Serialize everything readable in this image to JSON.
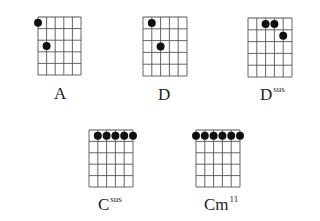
{
  "figure": {
    "strings": 6,
    "frets": 5,
    "line_color": "#555555",
    "dot_color": "#111111",
    "chords": [
      {
        "name": "A",
        "suffix": "",
        "position": "V",
        "grid": {
          "x": 38,
          "y": 17,
          "w": 43,
          "h": 58
        },
        "label": {
          "x": 54,
          "y": 85
        },
        "dots": [
          {
            "string": 1,
            "fret": 1
          },
          {
            "string": 2,
            "fret": 3
          }
        ]
      },
      {
        "name": "D",
        "suffix": "",
        "position": "V",
        "grid": {
          "x": 143,
          "y": 17,
          "w": 44,
          "h": 59
        },
        "label": {
          "x": 158,
          "y": 86
        },
        "dots": [
          {
            "string": 2,
            "fret": 1
          },
          {
            "string": 3,
            "fret": 3
          }
        ]
      },
      {
        "name": "D",
        "suffix": "sus",
        "position": "VII",
        "grid": {
          "x": 248,
          "y": 18,
          "w": 44,
          "h": 59
        },
        "label": {
          "x": 260,
          "y": 86
        },
        "dots": [
          {
            "string": 3,
            "fret": 1
          },
          {
            "string": 4,
            "fret": 1
          },
          {
            "string": 5,
            "fret": 2
          }
        ]
      },
      {
        "name": "C",
        "suffix": "sus",
        "position": "III",
        "grid": {
          "x": 89,
          "y": 130,
          "w": 44,
          "h": 57
        },
        "label": {
          "x": 98,
          "y": 196
        },
        "dots": [
          {
            "string": 2,
            "fret": 1
          },
          {
            "string": 3,
            "fret": 1
          },
          {
            "string": 4,
            "fret": 1
          },
          {
            "string": 5,
            "fret": 1
          },
          {
            "string": 6,
            "fret": 1
          }
        ]
      },
      {
        "name": "Cm",
        "suffix": "11",
        "position": "VIII",
        "grid": {
          "x": 196,
          "y": 130,
          "w": 44,
          "h": 57
        },
        "label": {
          "x": 204,
          "y": 196
        },
        "dots": [
          {
            "string": 1,
            "fret": 1
          },
          {
            "string": 2,
            "fret": 1
          },
          {
            "string": 3,
            "fret": 1
          },
          {
            "string": 4,
            "fret": 1
          },
          {
            "string": 5,
            "fret": 1
          },
          {
            "string": 6,
            "fret": 1
          }
        ]
      }
    ]
  }
}
